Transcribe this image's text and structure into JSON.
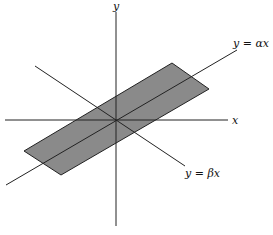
{
  "diagram": {
    "axes": {
      "x_label": "x",
      "y_label": "y"
    },
    "lines": [
      {
        "id": "alpha",
        "label": "y = αx"
      },
      {
        "id": "beta",
        "label": "y = βx"
      }
    ],
    "region": {
      "fill": "#808080",
      "stroke": "#222222"
    }
  }
}
